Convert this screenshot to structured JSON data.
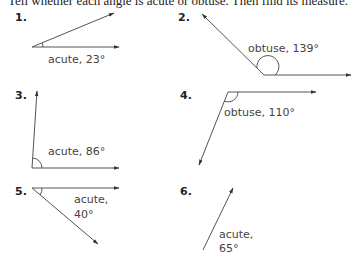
{
  "instructions": "Tell whether each angle is acute or obtuse. Then find its measure.",
  "problems": [
    {
      "number": "1.",
      "answer": "acute, 23°",
      "type": "acute",
      "measure": "23°"
    },
    {
      "number": "2.",
      "answer": "obtuse, 139°",
      "type": "obtuse",
      "measure": "139°"
    },
    {
      "number": "3.",
      "answer": "acute, 86°",
      "type": "acute",
      "measure": "86°"
    },
    {
      "number": "4.",
      "answer": "obtuse, 110°",
      "type": "obtuse",
      "measure": "110°"
    },
    {
      "number": "5.",
      "answer_line1": "acute,",
      "answer_line2": "40°",
      "type": "acute",
      "measure": "40°"
    },
    {
      "number": "6.",
      "answer_line1": "acute,",
      "answer_line2": "65°",
      "type": "acute",
      "measure": "65°"
    }
  ],
  "colors": {
    "line": "#555555",
    "text": "#444444",
    "number": "#222222"
  }
}
